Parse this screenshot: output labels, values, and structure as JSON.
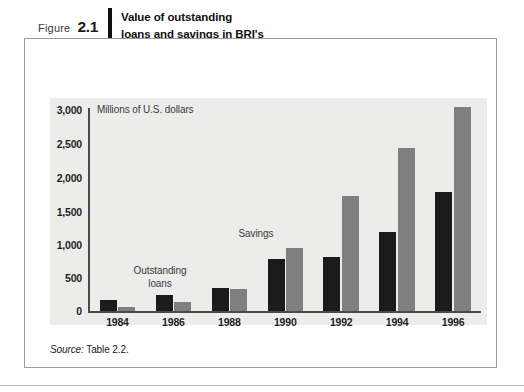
{
  "figure": {
    "label_word": "Figure",
    "number": "2.1",
    "title_lines": [
      "Value of outstanding",
      "loans and savings in BRI's",
      "unit desas, 1984–96"
    ],
    "source_word": "Source:",
    "source_text": " Table 2.2."
  },
  "colors": {
    "loans": "#1b1b1b",
    "savings": "#7f7f7f",
    "panel_bg": "#ececeb",
    "axis": "#4a4a4a",
    "frame": "#9a9a9a"
  },
  "chart_data": {
    "type": "bar",
    "title": "Value of outstanding loans and savings in BRI's unit desas, 1984–96",
    "subtitle": "Millions of U.S. dollars",
    "xlabel": "",
    "ylabel": "Millions of U.S. dollars",
    "ylim": [
      0,
      3000
    ],
    "ytick_labels": [
      "3,000",
      "2,500",
      "2,000",
      "1,500",
      "1,000",
      "500",
      "0"
    ],
    "ytick_values": [
      3000,
      2500,
      2000,
      1500,
      1000,
      500,
      0
    ],
    "grid": false,
    "legend_position": "inline-annotations",
    "categories": [
      "1984",
      "1986",
      "1988",
      "1990",
      "1992",
      "1994",
      "1996"
    ],
    "series": [
      {
        "name": "Outstanding loans",
        "color": "#1b1b1b",
        "values": [
          165,
          240,
          345,
          765,
          800,
          1170,
          1765
        ]
      },
      {
        "name": "Savings",
        "color": "#7f7f7f",
        "values": [
          60,
          135,
          330,
          930,
          1710,
          2420,
          3030
        ]
      }
    ],
    "annotations": [
      {
        "text_line1": "Outstanding",
        "text_line2": "loans",
        "target_series": "Outstanding loans"
      },
      {
        "text_line1": "Savings",
        "text_line2": "",
        "target_series": "Savings"
      }
    ]
  }
}
